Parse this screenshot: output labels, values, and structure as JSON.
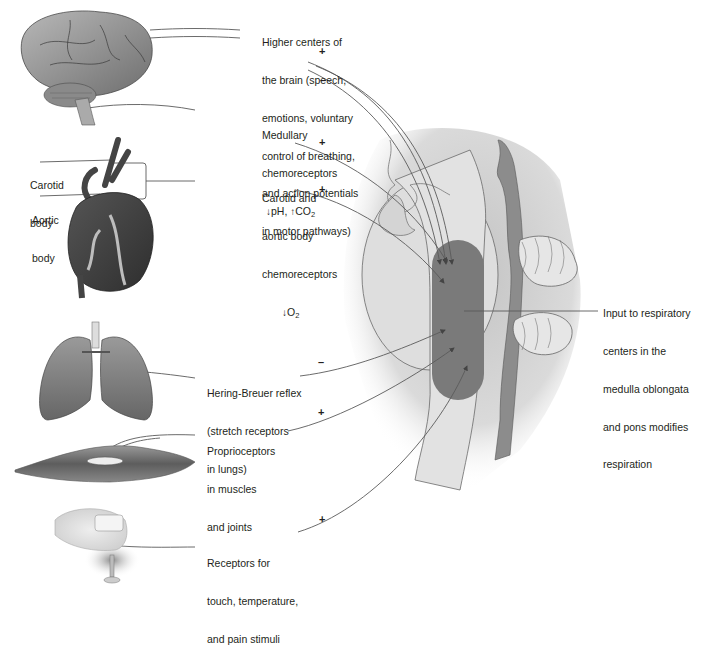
{
  "figure": {
    "colors": {
      "medulla_center": "#7a7a7a",
      "brainstem": "#dcdcdc",
      "pathway_line": "#5a5a5a",
      "text": "#231f20"
    }
  },
  "labels": {
    "higher_centers": {
      "lines": [
        "Higher centers of",
        "the brain (speech,",
        "emotions, voluntary",
        "control of breathing,",
        "and action potentials",
        "in motor pathways)"
      ],
      "signs": [
        "+",
        "–"
      ]
    },
    "medullary": {
      "lines": [
        "Medullary",
        "chemoreceptors"
      ],
      "line3_parts": {
        "arrow1": "↓",
        "text1": "pH, ",
        "arrow2": "↑",
        "text2": "CO",
        "sub": "2"
      },
      "sign": "+"
    },
    "carotid_aortic": {
      "lines": [
        "Carotid and",
        "aortic body",
        "chemoreceptors"
      ],
      "line4_parts": {
        "arrow": "↓",
        "text": "O",
        "sub": "2"
      },
      "sign": "+"
    },
    "carotid_body": {
      "lines": [
        "Carotid",
        "body"
      ]
    },
    "aortic_body": {
      "lines": [
        "Aortic",
        "body"
      ]
    },
    "hering_breuer": {
      "lines": [
        "Hering-Breuer reflex",
        "(stretch receptors",
        "in lungs)"
      ],
      "sign": "–"
    },
    "proprioceptors": {
      "lines": [
        "Proprioceptors",
        "in muscles",
        "and joints"
      ],
      "sign": "+"
    },
    "touch_receptors": {
      "lines": [
        "Receptors for",
        "touch, temperature,",
        "and pain stimuli"
      ],
      "sign": "+"
    },
    "respiratory_centers": {
      "lines": [
        "Input to respiratory",
        "centers in the",
        "medulla oblongata",
        "and pons modifies",
        "respiration"
      ]
    }
  },
  "illustrations": [
    "brain",
    "heart",
    "lungs",
    "muscle",
    "finger-on-pin",
    "head-sagittal-section"
  ]
}
